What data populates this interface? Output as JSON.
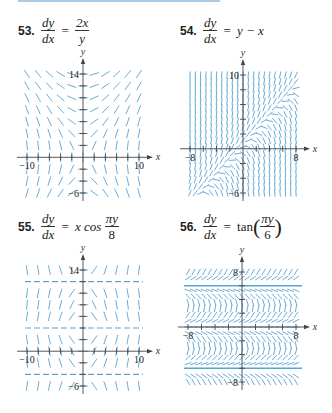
{
  "accent_color": "#5aa3d3",
  "axis_color": "#444444",
  "problems": [
    {
      "number": "53.",
      "lhs_num": "dy",
      "lhs_den": "dx",
      "rhs_type": "frac",
      "rhs_num": "2x",
      "rhs_den": "y",
      "graph": {
        "x_label": "x",
        "y_label": "y",
        "tick_labels": {
          "xmin": "−10",
          "xmax": "10",
          "ymax": "14",
          "ymin": "−6"
        },
        "xrange": [
          -10,
          10
        ],
        "yrange": [
          -6,
          14
        ],
        "px": {
          "x0": 27,
          "x1": 139,
          "y0": 193,
          "y1": 74
        },
        "formula": "2x/y"
      }
    },
    {
      "number": "54.",
      "lhs_num": "dy",
      "lhs_den": "dx",
      "rhs_type": "text",
      "rhs": "y − x",
      "graph": {
        "x_label": "x",
        "y_label": "y",
        "tick_labels": {
          "xmin": "−8",
          "xmax": "8",
          "ymax": "10",
          "ymin": "−6"
        },
        "xrange": [
          -8,
          8
        ],
        "yrange": [
          -6,
          10
        ],
        "px": {
          "x0": 190,
          "x1": 296,
          "y0": 193,
          "y1": 75
        },
        "formula": "y-x"
      }
    },
    {
      "number": "55.",
      "lhs_num": "dy",
      "lhs_den": "dx",
      "rhs_type": "cos",
      "rhs_pre": "x cos",
      "rhs_num": "πy",
      "rhs_den": "8",
      "graph": {
        "x_label": "x",
        "y_label": "y",
        "tick_labels": {
          "xmin": "−10",
          "xmax": "10",
          "ymax": "14",
          "ymin": "−6"
        },
        "xrange": [
          -10,
          10
        ],
        "yrange": [
          -6,
          14
        ],
        "px": {
          "x0": 27,
          "x1": 139,
          "y0": 386,
          "y1": 270
        },
        "formula": "x*cos(pi*y/8)"
      }
    },
    {
      "number": "56.",
      "lhs_num": "dy",
      "lhs_den": "dx",
      "rhs_type": "tan",
      "rhs_pre": "tan",
      "rhs_num": "πy",
      "rhs_den": "6",
      "graph": {
        "x_label": "x",
        "y_label": "y",
        "tick_labels": {
          "xmin": "−8",
          "xmax": "8",
          "ymax": "8",
          "ymin": "−8"
        },
        "xrange": [
          -8,
          8
        ],
        "yrange": [
          -8,
          8
        ],
        "px": {
          "x0": 188,
          "x1": 296,
          "y0": 382,
          "y1": 272
        },
        "formula": "tan(pi*y/6)"
      }
    }
  ]
}
